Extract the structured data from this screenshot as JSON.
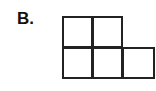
{
  "label": "B.",
  "grid": {
    "rows": [
      {
        "cells": 2
      },
      {
        "cells": 3
      }
    ],
    "stroke_color": "#222222",
    "fill_color": "#ffffff"
  }
}
